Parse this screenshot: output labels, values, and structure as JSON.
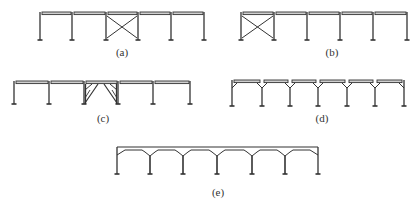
{
  "figure": {
    "stroke_color": "#333333",
    "fill_color": "#cfcfcf",
    "panels": [
      {
        "id": "a",
        "label": "(a)",
        "columns_x": [
          40,
          72,
          106,
          138,
          171,
          204
        ],
        "top_y": 12,
        "bottom_y": 40,
        "type": "beam-x-brace",
        "braced_bay": 2,
        "label_x": 122,
        "label_y": 46
      },
      {
        "id": "b",
        "label": "(b)",
        "columns_x": [
          241,
          274,
          307,
          340,
          373,
          407
        ],
        "top_y": 12,
        "bottom_y": 40,
        "type": "beam-x-brace",
        "braced_bay": 0,
        "label_x": 332,
        "label_y": 46
      },
      {
        "id": "c",
        "label": "(c)",
        "columns_x": [
          14,
          49,
          84,
          118,
          153,
          190
        ],
        "top_y": 81,
        "bottom_y": 104,
        "type": "beam-knee-brace",
        "braced_bay": 2,
        "label_x": 103,
        "label_y": 112
      },
      {
        "id": "d",
        "label": "(d)",
        "columns_x": [
          232,
          262,
          290,
          318,
          347,
          375,
          404
        ],
        "top_y": 80,
        "bottom_y": 106,
        "type": "y-column-beam",
        "label_x": 322,
        "label_y": 112
      },
      {
        "id": "e",
        "label": "(e)",
        "columns_x": [
          117,
          150,
          183,
          217,
          252,
          285,
          318
        ],
        "top_y": 147,
        "bottom_y": 174,
        "type": "y-column-arch",
        "label_x": 218,
        "label_y": 186
      }
    ]
  }
}
